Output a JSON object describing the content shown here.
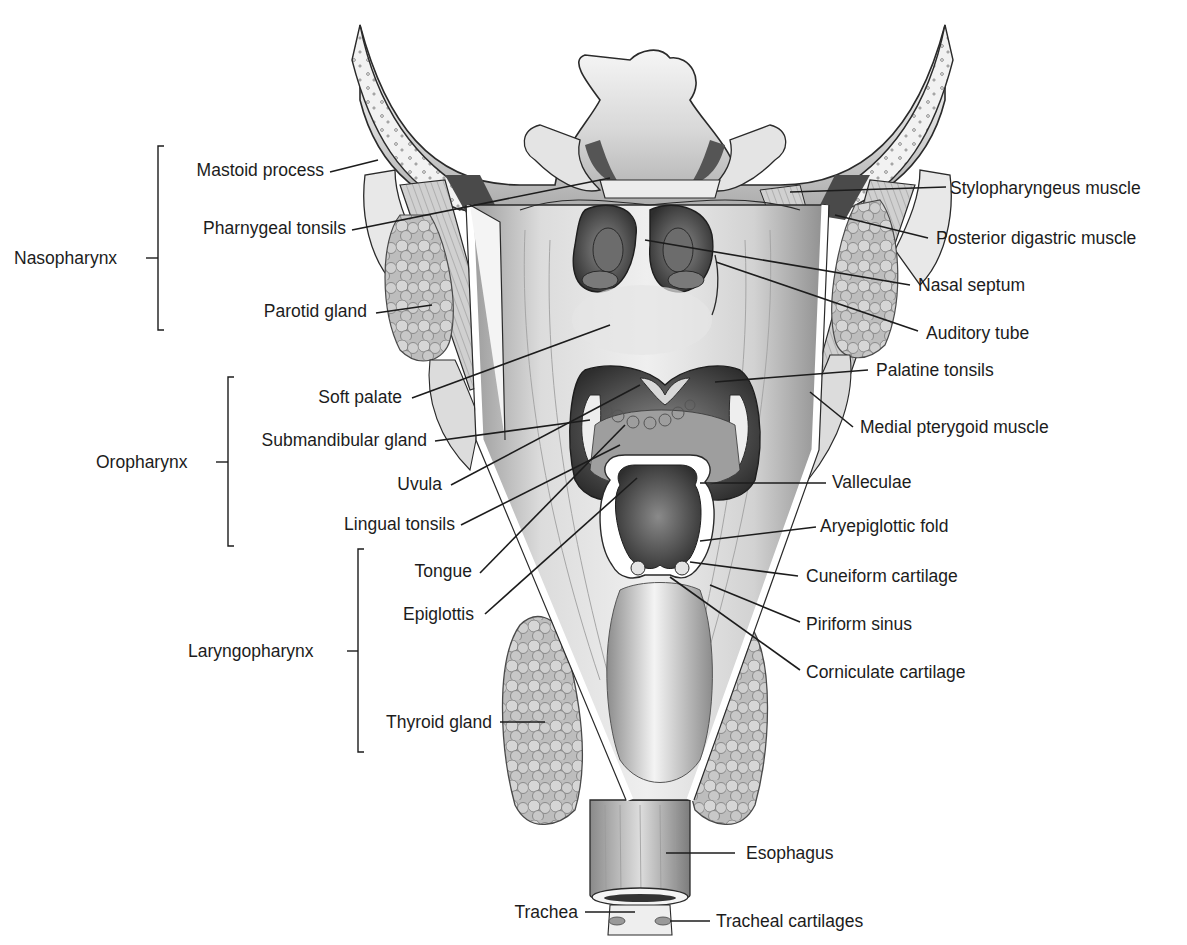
{
  "diagram": {
    "regions": [
      {
        "id": "nasopharynx",
        "label": "Nasopharynx"
      },
      {
        "id": "oropharynx",
        "label": "Oropharynx"
      },
      {
        "id": "laryngopharynx",
        "label": "Laryngopharynx"
      }
    ],
    "left_labels": [
      {
        "id": "mastoid-process",
        "label": "Mastoid process",
        "region": "nasopharynx"
      },
      {
        "id": "pharyngeal-tonsils",
        "label": "Pharnygeal tonsils",
        "region": "nasopharynx"
      },
      {
        "id": "parotid-gland",
        "label": "Parotid gland",
        "region": "nasopharynx"
      },
      {
        "id": "soft-palate",
        "label": "Soft palate",
        "region": "oropharynx"
      },
      {
        "id": "submandibular-gland",
        "label": "Submandibular gland",
        "region": "oropharynx"
      },
      {
        "id": "uvula",
        "label": "Uvula",
        "region": "oropharynx"
      },
      {
        "id": "lingual-tonsils",
        "label": "Lingual tonsils",
        "region": "oropharynx"
      },
      {
        "id": "tongue",
        "label": "Tongue",
        "region": "laryngopharynx"
      },
      {
        "id": "epiglottis",
        "label": "Epiglottis",
        "region": "laryngopharynx"
      },
      {
        "id": "thyroid-gland",
        "label": "Thyroid gland",
        "region": "laryngopharynx"
      }
    ],
    "right_labels": [
      {
        "id": "stylopharyngeus-muscle",
        "label": "Stylopharyngeus muscle"
      },
      {
        "id": "posterior-digastric-muscle",
        "label": "Posterior digastric muscle"
      },
      {
        "id": "nasal-septum",
        "label": "Nasal septum"
      },
      {
        "id": "auditory-tube",
        "label": "Auditory tube"
      },
      {
        "id": "palatine-tonsils",
        "label": "Palatine tonsils"
      },
      {
        "id": "medial-pterygoid-muscle",
        "label": "Medial pterygoid muscle"
      },
      {
        "id": "valleculae",
        "label": "Valleculae"
      },
      {
        "id": "aryepiglottic-fold",
        "label": "Aryepiglottic fold"
      },
      {
        "id": "cuneiform-cartilage",
        "label": "Cuneiform cartilage"
      },
      {
        "id": "piriform-sinus",
        "label": "Piriform sinus"
      },
      {
        "id": "corniculate-cartilage",
        "label": "Corniculate cartilage"
      },
      {
        "id": "esophagus",
        "label": "Esophagus"
      },
      {
        "id": "tracheal-cartilages",
        "label": "Tracheal cartilages"
      }
    ],
    "bottom_labels": [
      {
        "id": "trachea",
        "label": "Trachea"
      }
    ],
    "colors": {
      "ink": "#1c1c1c",
      "tissue_light": "#e6e6e6",
      "tissue_mid": "#b5b5b5",
      "tissue_dark": "#6e6e6e",
      "cavity": "#3a3a3a",
      "background": "#ffffff"
    }
  }
}
